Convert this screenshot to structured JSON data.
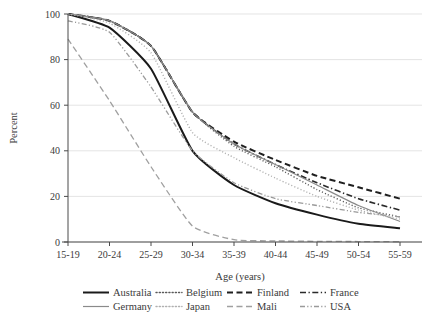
{
  "chart_data": {
    "type": "line",
    "title": "",
    "xlabel": "Age (years)",
    "ylabel": "Percent",
    "categories": [
      "15-19",
      "20-24",
      "25-29",
      "30-34",
      "35-39",
      "40-44",
      "45-49",
      "50-54",
      "55-59"
    ],
    "ylim": [
      0,
      100
    ],
    "yticks": [
      0,
      20,
      40,
      60,
      80,
      100
    ],
    "grid": "horizontal",
    "legend_position": "bottom",
    "series": [
      {
        "name": "Australia",
        "style": "solid",
        "color": "#1a1a1a",
        "width": 2.0,
        "values": [
          100,
          94,
          76,
          40,
          25,
          17,
          12,
          8,
          6
        ]
      },
      {
        "name": "Belgium",
        "style": "dotted",
        "color": "#5a5a5a",
        "width": 1.4,
        "values": [
          100,
          97,
          86,
          57,
          42,
          33,
          23,
          15,
          11
        ]
      },
      {
        "name": "Finland",
        "style": "dashed",
        "color": "#1f1f1f",
        "width": 2.0,
        "values": [
          100,
          97,
          86,
          57,
          44,
          36,
          29,
          24,
          19
        ]
      },
      {
        "name": "France",
        "style": "dashdot",
        "color": "#2a2a2a",
        "width": 1.6,
        "values": [
          100,
          97,
          86,
          57,
          43,
          34,
          26,
          19,
          14
        ]
      },
      {
        "name": "Germany",
        "style": "solid",
        "color": "#8a8a8a",
        "width": 1.2,
        "values": [
          100,
          97,
          86,
          57,
          43,
          34,
          25,
          16,
          9
        ]
      },
      {
        "name": "Japan",
        "style": "dotted",
        "color": "#b0b0b0",
        "width": 1.4,
        "values": [
          100,
          96,
          83,
          48,
          37,
          28,
          20,
          14,
          10
        ]
      },
      {
        "name": "Mali",
        "style": "dashed",
        "color": "#a0a0a0",
        "width": 1.3,
        "values": [
          89,
          62,
          33,
          7,
          1,
          0.5,
          0.3,
          0.2,
          0.1
        ]
      },
      {
        "name": "USA",
        "style": "dashdotdot",
        "color": "#9a9a9a",
        "width": 1.3,
        "values": [
          97,
          92,
          68,
          40,
          26,
          19,
          16,
          13,
          11
        ]
      }
    ]
  },
  "legend": {
    "entries": [
      {
        "label": "Australia"
      },
      {
        "label": "Belgium"
      },
      {
        "label": "Finland"
      },
      {
        "label": "France"
      },
      {
        "label": "Germany"
      },
      {
        "label": "Japan"
      },
      {
        "label": "Mali"
      },
      {
        "label": "USA"
      }
    ]
  },
  "axes": {
    "y_tick_labels": [
      "0",
      "20",
      "40",
      "60",
      "80",
      "100"
    ],
    "x_tick_labels": [
      "15-19",
      "20-24",
      "25-29",
      "30-34",
      "35-39",
      "40-44",
      "45-49",
      "50-54",
      "55-59"
    ],
    "x_title": "Age (years)",
    "y_title": "Percent"
  }
}
